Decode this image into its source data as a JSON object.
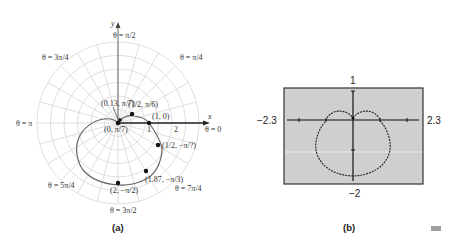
{
  "panel_a": {
    "caption": "(a)",
    "axis_labels": {
      "x": "x",
      "y": "y"
    },
    "tick_labels": [
      "1",
      "2"
    ],
    "angle_labels": [
      {
        "id": "pi_over_2",
        "text": "θ = π/2"
      },
      {
        "id": "pi_over_4",
        "text": "θ = π/4"
      },
      {
        "id": "three_pi_over_4",
        "text": "θ = 3π/4"
      },
      {
        "id": "pi",
        "text": "θ = π"
      },
      {
        "id": "zero",
        "text": "θ = 0"
      },
      {
        "id": "five_pi_over_4",
        "text": "θ = 5π/4"
      },
      {
        "id": "three_pi_over_2",
        "text": "θ = 3π/2"
      },
      {
        "id": "seven_pi_over_4",
        "text": "θ = 7π/4"
      }
    ],
    "points": [
      {
        "label": "(0, π/7)",
        "r": 0,
        "theta": "π/7"
      },
      {
        "label": "(0.13, π/7)",
        "r": 0.13,
        "theta": "π/7"
      },
      {
        "label": "(1/2, π/6)",
        "r": 0.5,
        "theta": "π/6"
      },
      {
        "label": "(1, 0)",
        "r": 1,
        "theta": "0"
      },
      {
        "label": "(1/2, −π/?)",
        "r": 1.5,
        "theta": "−π/6"
      },
      {
        "label": "(1.87, −π/3)",
        "r": 1.87,
        "theta": "−π/3"
      },
      {
        "label": "(2, −π/2)",
        "r": 2,
        "theta": "−π/2"
      }
    ]
  },
  "panel_b": {
    "caption": "(b)",
    "window": {
      "xmin": "−2.3",
      "xmax": "2.3",
      "ymin": "−2",
      "ymax": "1"
    }
  },
  "colors": {
    "grid": "#d4d4d4",
    "curve": "#555555",
    "screen_bg": "#cfcfcf",
    "axis": "#111111",
    "marker": "#a0a0a0"
  }
}
